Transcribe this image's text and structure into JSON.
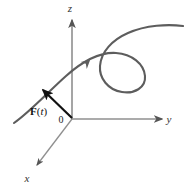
{
  "figure": {
    "background_color": "#ffffff"
  },
  "axes": {
    "color": "#8a8a8a",
    "arrow_color": "#555555",
    "items": [
      {
        "name": "z-axis",
        "label": "z",
        "label_x": 70,
        "label_y": 12,
        "from_x": 72,
        "from_y": 119,
        "to_x": 72,
        "to_y": 20
      },
      {
        "name": "y-axis",
        "label": "y",
        "label_x": 169,
        "label_y": 123,
        "from_x": 72,
        "from_y": 119,
        "to_x": 162,
        "to_y": 119
      },
      {
        "name": "x-axis",
        "label": "x",
        "label_x": 27,
        "label_y": 182,
        "from_x": 72,
        "from_y": 119,
        "to_x": 37,
        "to_y": 165
      }
    ]
  },
  "origin": {
    "label": "0",
    "x": 72,
    "y": 119,
    "label_x": 61,
    "label_y": 123
  },
  "curve": {
    "name": "space-curve",
    "color": "#5d5d5d",
    "stroke_width": 2.1,
    "path": "M 14 123 C 30 112 48 92 66 76 C 84 60 100 52 116 53 C 132 54 144 64 145 76 C 146 88 134 94 122 92 C 108 90 99 78 100 66 C 101 52 112 40 128 33 C 146 25 168 24 183 26",
    "direction_arrow": {
      "name": "curve-direction-arrow",
      "x": 89,
      "y": 61,
      "angle_deg": -40
    }
  },
  "vector": {
    "name": "force-vector",
    "color": "#111111",
    "stroke_width": 2.2,
    "from_x": 72,
    "from_y": 118,
    "to_x": 41,
    "to_y": 88,
    "label": {
      "bold_part": "F",
      "open_paren": "(",
      "italic_part": "t",
      "close_paren": ")",
      "full": "F(t)",
      "x": 30,
      "y": 115
    }
  }
}
